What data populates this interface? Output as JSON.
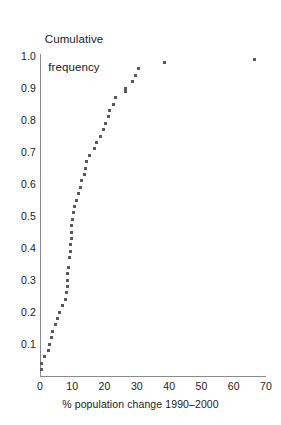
{
  "chart_data": {
    "type": "scatter",
    "title": "",
    "ylabel": "Cumulative\nfrequency",
    "ylabel_line1": "Cumulative",
    "ylabel_line2": "frequency",
    "xlabel": "% population change 1990–2000",
    "xlim": [
      0,
      70
    ],
    "ylim": [
      0,
      1.0
    ],
    "xticks": [
      0,
      10,
      20,
      30,
      40,
      50,
      60,
      70
    ],
    "xtick_labels": [
      "0",
      "10",
      "20",
      "30",
      "40",
      "50",
      "60",
      "70"
    ],
    "yticks": [
      0.1,
      0.2,
      0.3,
      0.4,
      0.5,
      0.6,
      0.7,
      0.8,
      0.9,
      1.0
    ],
    "ytick_labels": [
      "0.1",
      "0.2",
      "0.3",
      "0.4",
      "0.5",
      "0.6",
      "0.7",
      "0.8",
      "0.9",
      "1.0"
    ],
    "grid": false,
    "legend": null,
    "marker": "square",
    "marker_color": "#555a5e",
    "axis_color": "#8a8a8a",
    "series": [
      {
        "name": "Cumulative frequency of % population change",
        "points": [
          [
            0.5,
            0.02
          ],
          [
            0.6,
            0.04
          ],
          [
            1.4,
            0.06
          ],
          [
            2.5,
            0.08
          ],
          [
            3.0,
            0.1
          ],
          [
            3.6,
            0.12
          ],
          [
            4.0,
            0.14
          ],
          [
            4.7,
            0.16
          ],
          [
            5.5,
            0.18
          ],
          [
            5.9,
            0.2
          ],
          [
            6.9,
            0.22
          ],
          [
            7.9,
            0.24
          ],
          [
            8.2,
            0.26
          ],
          [
            8.5,
            0.28
          ],
          [
            8.6,
            0.3
          ],
          [
            8.6,
            0.32
          ],
          [
            8.9,
            0.34
          ],
          [
            9.1,
            0.37
          ],
          [
            9.3,
            0.39
          ],
          [
            9.6,
            0.41
          ],
          [
            9.7,
            0.43
          ],
          [
            9.8,
            0.45
          ],
          [
            9.9,
            0.47
          ],
          [
            10.1,
            0.49
          ],
          [
            10.5,
            0.51
          ],
          [
            10.8,
            0.53
          ],
          [
            11.4,
            0.55
          ],
          [
            12.0,
            0.57
          ],
          [
            12.4,
            0.59
          ],
          [
            12.9,
            0.61
          ],
          [
            13.7,
            0.63
          ],
          [
            14.1,
            0.65
          ],
          [
            14.4,
            0.67
          ],
          [
            15.3,
            0.69
          ],
          [
            17.0,
            0.71
          ],
          [
            17.6,
            0.73
          ],
          [
            18.8,
            0.75
          ],
          [
            19.6,
            0.77
          ],
          [
            20.4,
            0.79
          ],
          [
            21.1,
            0.81
          ],
          [
            21.4,
            0.83
          ],
          [
            22.8,
            0.85
          ],
          [
            23.5,
            0.87
          ],
          [
            26.4,
            0.89
          ],
          [
            26.5,
            0.9
          ],
          [
            28.5,
            0.92
          ],
          [
            29.6,
            0.94
          ],
          [
            30.6,
            0.96
          ],
          [
            38.6,
            0.98
          ],
          [
            66.3,
            0.99
          ]
        ]
      }
    ]
  },
  "axes": {
    "y_axis_name": "cumulative-frequency-axis",
    "x_axis_name": "population-change-axis"
  }
}
